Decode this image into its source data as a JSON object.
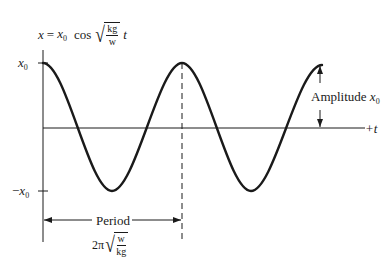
{
  "figure": {
    "equation": {
      "lhs": "x",
      "eq": "=",
      "amp_var": "x",
      "amp_sub": "0",
      "func": "cos",
      "frac_num": "kg",
      "frac_den": "w",
      "var": "t"
    },
    "y_axis": {
      "top_label_var": "x",
      "top_label_sub": "0",
      "bottom_label_prefix": "−",
      "bottom_label_var": "x",
      "bottom_label_sub": "0"
    },
    "x_axis": {
      "label": "+t"
    },
    "amplitude": {
      "label": "Amplitude",
      "var": "x",
      "sub": "0"
    },
    "period": {
      "label": "Period",
      "formula_prefix": "2π",
      "frac_num": "w",
      "frac_den": "kg"
    },
    "colors": {
      "ink": "#1a1a1a",
      "background": "#ffffff"
    }
  }
}
